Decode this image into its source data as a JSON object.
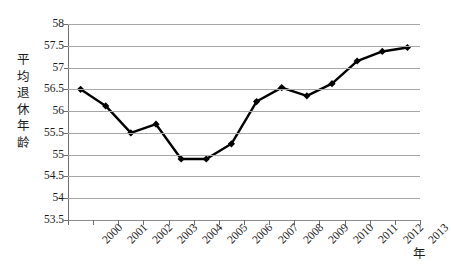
{
  "chart_data": {
    "type": "line",
    "title": "",
    "xlabel": "年",
    "ylabel": "平均退休年龄",
    "categories": [
      "2000",
      "2001",
      "2002",
      "2003",
      "2004",
      "2005",
      "2006",
      "2007",
      "2008",
      "2009",
      "2010",
      "2011",
      "2012",
      "2013"
    ],
    "values": [
      56.5,
      56.12,
      55.5,
      55.7,
      54.9,
      54.9,
      55.25,
      56.22,
      56.54,
      56.35,
      56.63,
      57.15,
      57.37,
      57.46
    ],
    "series": [
      {
        "name": "平均退休年龄",
        "values": [
          56.5,
          56.12,
          55.5,
          55.7,
          54.9,
          54.9,
          55.25,
          56.22,
          56.54,
          56.35,
          56.63,
          57.15,
          57.37,
          57.46
        ]
      }
    ],
    "ylim": [
      53.5,
      58
    ],
    "ytick_labels": [
      "58",
      "57.5",
      "57",
      "56.5",
      "56",
      "55.5",
      "55",
      "54.5",
      "54",
      "53.5"
    ],
    "ytick_values": [
      58,
      57.5,
      57,
      56.5,
      56,
      55.5,
      55,
      54.5,
      54,
      53.5
    ],
    "ystep": 0.5,
    "grid": true,
    "legend": false,
    "legend_position": "none",
    "marker": "diamond",
    "line_color": "#000000",
    "marker_color": "#000000",
    "gridline_color": "#a6a6a6",
    "axis_color": "#6e6e6e",
    "background_color": "#ffffff"
  },
  "axes": {
    "y_title_chars": "平\n均\n退\n休\n年\n龄",
    "x_title": "年"
  }
}
